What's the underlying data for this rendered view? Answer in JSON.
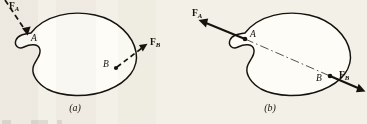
{
  "figure": {
    "background_color": "#f3f0e8",
    "ink_color": "#16130e",
    "panels": [
      {
        "id": "a",
        "caption": "(a)",
        "body_fill": "#fdfcf7",
        "line_style": "dashed",
        "points": [
          {
            "id": "A",
            "label": "A"
          },
          {
            "id": "B",
            "label": "B"
          }
        ],
        "forces": [
          {
            "id": "FA",
            "label": "F",
            "subscript": "A",
            "style": "dashed",
            "direction": "down-right",
            "applied_at": "A",
            "arrowhead_at": "A",
            "label_clipped_top": true
          },
          {
            "id": "FB",
            "label": "F",
            "subscript": "B",
            "style": "dashed",
            "direction": "up-right",
            "applied_at": "B",
            "arrowhead_at": "tip"
          }
        ]
      },
      {
        "id": "b",
        "caption": "(b)",
        "body_fill": "#fdfcf7",
        "line_style": "solid",
        "centerline_style": "dash-dot",
        "points": [
          {
            "id": "A",
            "label": "A"
          },
          {
            "id": "B",
            "label": "B"
          }
        ],
        "forces": [
          {
            "id": "FA",
            "label": "F",
            "subscript": "A",
            "style": "solid",
            "direction": "up-left",
            "applied_at": "A",
            "arrowhead_at": "tip"
          },
          {
            "id": "FB",
            "label": "F",
            "subscript": "B",
            "style": "solid",
            "direction": "down-right",
            "applied_at": "B",
            "arrowhead_at": "tip"
          }
        ]
      }
    ]
  }
}
